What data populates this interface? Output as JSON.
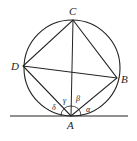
{
  "diagram": {
    "points": {
      "A": "A",
      "B": "B",
      "C": "C",
      "D": "D"
    },
    "angles": {
      "alpha": "α",
      "beta": "β",
      "gamma": "γ",
      "delta": "δ"
    },
    "stroke_color": "#222222"
  }
}
